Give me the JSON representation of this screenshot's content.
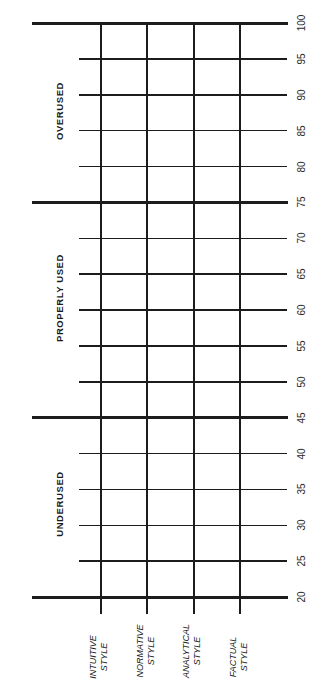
{
  "title_fragment": "",
  "scale": {
    "min": 20,
    "max": 100,
    "step": 5,
    "ticks": [
      "100",
      "95",
      "90",
      "85",
      "80",
      "75",
      "70",
      "65",
      "60",
      "55",
      "50",
      "45",
      "40",
      "35",
      "30",
      "25",
      "20"
    ]
  },
  "zones": [
    {
      "label": "OVERUSED",
      "from": 75,
      "to": 100
    },
    {
      "label": "PROPERLY USED",
      "from": 45,
      "to": 75
    },
    {
      "label": "UNDERUSED",
      "from": 20,
      "to": 45
    }
  ],
  "styles": [
    {
      "line1": "INTUITIVE",
      "line2": "STYLE"
    },
    {
      "line1": "NORMATIVE",
      "line2": "STYLE"
    },
    {
      "line1": "ANALYTICAL",
      "line2": "STYLE"
    },
    {
      "line1": "FACTUAL",
      "line2": "STYLE"
    }
  ],
  "colors": {
    "line": "#1c1c1c",
    "text": "#1a1a1a",
    "background": "#ffffff"
  }
}
